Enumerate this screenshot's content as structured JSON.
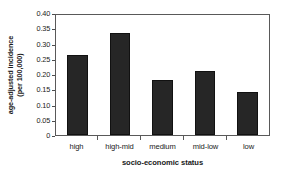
{
  "chart_data": {
    "type": "bar",
    "title": "",
    "categories": [
      "high",
      "high-mid",
      "medium",
      "mid-low",
      "low"
    ],
    "values": [
      0.262,
      0.334,
      0.18,
      0.211,
      0.142
    ],
    "xlabel": "socio-economic status",
    "ylabel_line1": "age-adjusted incidence",
    "ylabel_line2": "(per 100,000)",
    "ylim": [
      0,
      0.4
    ],
    "ytick_values": [
      0.4,
      0.35,
      0.3,
      0.25,
      0.2,
      0.15,
      0.1,
      0.05,
      0
    ],
    "ytick_labels": [
      "0.40",
      "0.35",
      "0.30",
      "0.25",
      "0.20",
      "0.15",
      "0.10",
      "0.05",
      "0"
    ],
    "grid": false,
    "legend": false,
    "bar_color": "#262626",
    "axis_color": "#595959",
    "text_color": "#1a1a1a",
    "background": "#ffffff"
  }
}
